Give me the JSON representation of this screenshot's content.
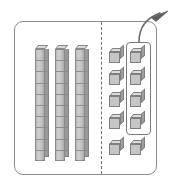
{
  "diagram": {
    "frame": {
      "label": "block workspace frame",
      "border_color": "#8c8c8c"
    },
    "divider": {
      "label": "dashed place-value divider",
      "style": "dashed",
      "color": "#6e6e6e",
      "orientation": "vertical"
    },
    "left_group": {
      "label": "tens rods group",
      "place_value": "tens",
      "rod_count": 3,
      "units_per_rod": 10,
      "total_units": 30,
      "rods": [
        {
          "name": "ten-rod-1",
          "segments": 10
        },
        {
          "name": "ten-rod-2",
          "segments": 10
        },
        {
          "name": "ten-rod-3",
          "segments": 10
        }
      ]
    },
    "right_group": {
      "label": "unit cubes group",
      "place_value": "ones",
      "columns": 2,
      "rows": 5,
      "cube_count": 10,
      "cubes": [
        {
          "name": "unit-cube-1",
          "column": 1,
          "row": 1,
          "selected": false
        },
        {
          "name": "unit-cube-2",
          "column": 2,
          "row": 1,
          "selected": true
        },
        {
          "name": "unit-cube-3",
          "column": 1,
          "row": 2,
          "selected": false
        },
        {
          "name": "unit-cube-4",
          "column": 2,
          "row": 2,
          "selected": true
        },
        {
          "name": "unit-cube-5",
          "column": 1,
          "row": 3,
          "selected": false
        },
        {
          "name": "unit-cube-6",
          "column": 2,
          "row": 3,
          "selected": true
        },
        {
          "name": "unit-cube-7",
          "column": 1,
          "row": 4,
          "selected": false
        },
        {
          "name": "unit-cube-8",
          "column": 2,
          "row": 4,
          "selected": true
        },
        {
          "name": "unit-cube-9",
          "column": 1,
          "row": 5,
          "selected": false
        },
        {
          "name": "unit-cube-10",
          "column": 2,
          "row": 5,
          "selected": false
        }
      ]
    },
    "highlight": {
      "label": "selection box around four unit cubes",
      "selected_count": 4,
      "border_color": "#7a7a7a"
    },
    "arrow": {
      "label": "curved move-out arrow",
      "direction": "up-right",
      "color": "#6a6a6a",
      "style": "curved with arrowhead"
    },
    "colors": {
      "block_face": "#c6c6c6",
      "block_top": "#dcdcdc",
      "block_side": "#9f9f9f",
      "outline": "#7f7f7f",
      "frame": "#8c8c8c",
      "background": "#ffffff"
    }
  }
}
